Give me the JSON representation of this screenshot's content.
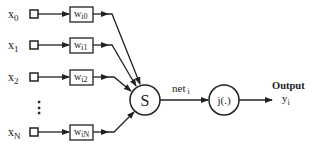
{
  "diagram": {
    "inputs": [
      {
        "label": "x",
        "sub": "0",
        "weight": "w",
        "weight_sub": "i0"
      },
      {
        "label": "x",
        "sub": "1",
        "weight": "w",
        "weight_sub": "i1"
      },
      {
        "label": "x",
        "sub": "2",
        "weight": "w",
        "weight_sub": "i2"
      },
      {
        "label": "x",
        "sub": "N",
        "weight": "w",
        "weight_sub": "iN"
      }
    ],
    "ellipsis": "⋮",
    "sum_node": {
      "label": "S"
    },
    "net_label": {
      "text": "net",
      "sub": "i"
    },
    "activation_node": {
      "label": "j(.)"
    },
    "output": {
      "title": "Output",
      "label": "y",
      "sub": "i"
    },
    "colors": {
      "stroke": "#222222",
      "background": "#ffffff"
    }
  }
}
